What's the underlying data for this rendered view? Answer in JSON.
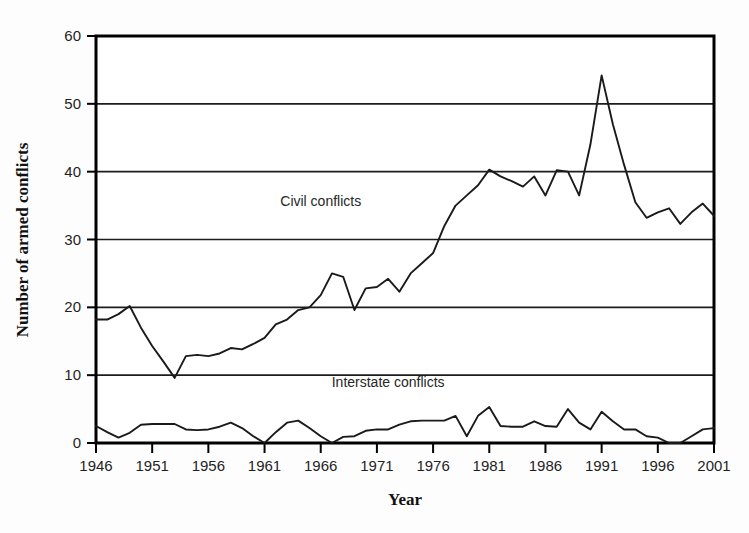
{
  "chart_data": {
    "type": "line",
    "title": "",
    "xlabel": "Year",
    "ylabel": "Number of armed conflicts",
    "xlim": [
      1946,
      2001
    ],
    "ylim": [
      0,
      60
    ],
    "xticks": [
      1946,
      1951,
      1956,
      1961,
      1966,
      1971,
      1976,
      1981,
      1986,
      1991,
      1996,
      2001
    ],
    "xtick_labels": [
      "1946",
      "1951",
      "1956",
      "1961",
      "1966",
      "1971",
      "1976",
      "1981",
      "1986",
      "1991",
      "1996",
      "2001"
    ],
    "yticks": [
      0,
      10,
      20,
      30,
      40,
      50,
      60
    ],
    "ytick_labels": [
      "0",
      "10",
      "20",
      "30",
      "40",
      "50",
      "60"
    ],
    "grid": "horizontal",
    "legend_position": "inline-annotation",
    "x": [
      1946,
      1947,
      1948,
      1949,
      1950,
      1951,
      1952,
      1953,
      1954,
      1955,
      1956,
      1957,
      1958,
      1959,
      1960,
      1961,
      1962,
      1963,
      1964,
      1965,
      1966,
      1967,
      1968,
      1969,
      1970,
      1971,
      1972,
      1973,
      1974,
      1975,
      1976,
      1977,
      1978,
      1979,
      1980,
      1981,
      1982,
      1983,
      1984,
      1985,
      1986,
      1987,
      1988,
      1989,
      1990,
      1991,
      1992,
      1993,
      1994,
      1995,
      1996,
      1997,
      1998,
      1999,
      2000,
      2001
    ],
    "series": [
      {
        "name": "Civil conflicts",
        "label": "Civil conflicts",
        "label_x": 1966,
        "label_y": 35,
        "values": [
          18.2,
          18.2,
          19.0,
          20.2,
          17.0,
          14.3,
          12.0,
          9.6,
          12.8,
          13.0,
          12.8,
          13.2,
          14.0,
          13.8,
          14.6,
          15.5,
          17.5,
          18.2,
          19.6,
          20.0,
          21.8,
          25.0,
          24.5,
          19.6,
          22.8,
          23.0,
          24.2,
          22.3,
          25.0,
          26.5,
          28.0,
          32.0,
          35.0,
          36.5,
          38.0,
          40.3,
          39.3,
          38.6,
          37.8,
          39.3,
          36.5,
          40.2,
          40.0,
          36.5,
          44.0,
          54.2,
          47.0,
          41.0,
          35.5,
          33.2,
          34.0,
          34.6,
          32.3,
          34.0,
          35.3,
          33.5
        ]
      },
      {
        "name": "Interstate conflicts",
        "label": "Interstate conflicts",
        "label_x": 1972,
        "label_y": 8.2,
        "values": [
          2.5,
          1.6,
          0.8,
          1.5,
          2.7,
          2.8,
          2.8,
          2.8,
          2.0,
          1.9,
          2.0,
          2.4,
          3.0,
          2.2,
          1.0,
          0.0,
          1.6,
          3.0,
          3.3,
          2.2,
          1.0,
          0.0,
          0.9,
          1.0,
          1.8,
          2.0,
          2.0,
          2.7,
          3.2,
          3.3,
          3.3,
          3.3,
          4.0,
          1.0,
          4.0,
          5.3,
          2.5,
          2.4,
          2.4,
          3.2,
          2.5,
          2.4,
          5.0,
          3.0,
          2.0,
          4.6,
          3.2,
          2.0,
          2.0,
          1.0,
          0.8,
          0.0,
          0.0,
          1.0,
          2.0,
          2.2
        ]
      }
    ]
  },
  "axes": {
    "y_axis_title": "Number of armed conflicts",
    "x_axis_title": "Year"
  }
}
